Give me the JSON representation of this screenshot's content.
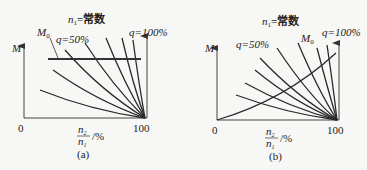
{
  "figure": {
    "panels": [
      {
        "id": "a",
        "caption": "(a)",
        "title_var": "n",
        "title_sub": "1",
        "title_rest": "=常数",
        "y_label": "M",
        "m0_label": "M",
        "m0_sub": "0",
        "q_low_label": "q=50%",
        "q_high_label": "q=100%",
        "x_origin": "0",
        "x_end": "100",
        "x_label_num": "n",
        "x_label_num_sub": "2",
        "x_label_den": "n",
        "x_label_den_sub": "1",
        "x_label_unit": "/%",
        "load_line": "horizontal constant torque M0"
      },
      {
        "id": "b",
        "caption": "(b)",
        "title_var": "n",
        "title_sub": "1",
        "title_rest": "=常数",
        "y_label": "M",
        "m0_label": "M",
        "m0_sub": "0",
        "q_low_label": "q=50%",
        "q_high_label": "q=100%",
        "x_origin": "0",
        "x_end": "100",
        "x_label_num": "n",
        "x_label_num_sub": "2",
        "x_label_den": "n",
        "x_label_den_sub": "1",
        "x_label_unit": "/%",
        "load_line": "rising parabolic load torque M0"
      }
    ]
  }
}
